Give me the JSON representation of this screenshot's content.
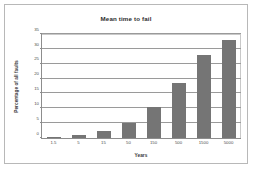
{
  "chart_data": {
    "type": "bar",
    "title": "Mean time to fail",
    "xlabel": "Years",
    "ylabel": "Percentage of all faults",
    "categories": [
      "1.5",
      "5",
      "15",
      "50",
      "150",
      "500",
      "1500",
      "5000"
    ],
    "values": [
      0.5,
      1,
      2.5,
      5,
      10.5,
      18.5,
      28,
      33
    ],
    "ylim": [
      0,
      35
    ],
    "yticks": [
      0,
      5,
      10,
      15,
      20,
      25,
      30,
      35
    ],
    "ytick_labels": [
      "0",
      "5",
      "10",
      "15",
      "20",
      "25",
      "30",
      "35"
    ],
    "grid": true,
    "legend": false,
    "series_color": "#757575"
  }
}
